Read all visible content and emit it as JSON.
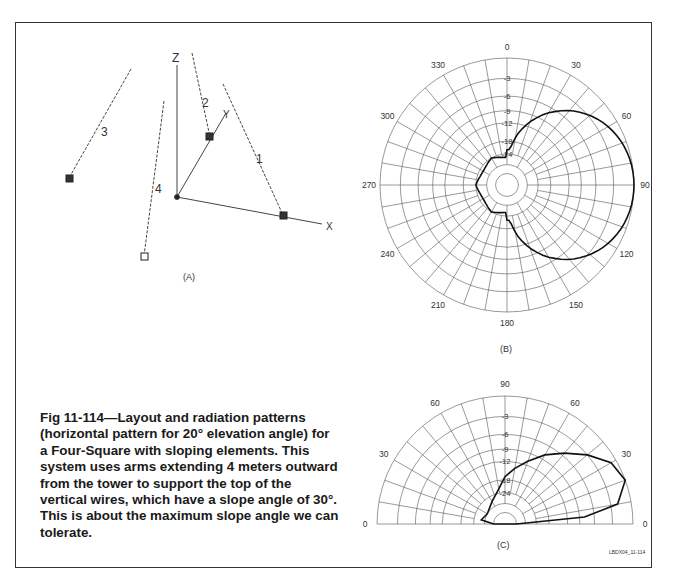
{
  "figure": {
    "caption": "Fig 11-114—Layout and radiation patterns (horizontal pattern for 20° elevation angle) for a Four-Square with sloping elements. This system uses arms extending 4 meters outward from the tower to support the top of the vertical wires, which have a slope angle of 30°. This is about the maximum slope angle we can tolerate.",
    "credit": "LBDX04_11-114"
  },
  "panel_a": {
    "label": "(A)",
    "axes": {
      "z": "Z",
      "y": "Y",
      "x": "X"
    },
    "elements": [
      "1",
      "2",
      "3",
      "4"
    ]
  },
  "panel_b": {
    "label": "(B)",
    "angle_labels": [
      "0",
      "30",
      "60",
      "90",
      "120",
      "150",
      "180",
      "210",
      "240",
      "270",
      "300",
      "330"
    ],
    "db_labels": [
      "-3",
      "-6",
      "-9",
      "-12",
      "-18",
      "-24"
    ]
  },
  "panel_c": {
    "label": "(C)",
    "angle_labels_left": [
      "0",
      "30",
      "60"
    ],
    "angle_label_top": "90",
    "angle_labels_right": [
      "60",
      "30",
      "0"
    ],
    "db_labels": [
      "-3",
      "-6",
      "-9",
      "-12",
      "-18",
      "-24"
    ]
  },
  "chart_data": [
    {
      "type": "polar",
      "title": "(B) Azimuth pattern at 20° elevation",
      "angle_unit": "degrees",
      "radial_unit": "dB",
      "radial_rings_db": [
        0,
        -3,
        -6,
        -9,
        -12,
        -18,
        -24
      ],
      "angular_ticks": [
        0,
        30,
        60,
        90,
        120,
        150,
        180,
        210,
        240,
        270,
        300,
        330
      ],
      "series": [
        {
          "name": "Four-Square sloping elements",
          "points": [
            {
              "az": 0,
              "db": -22
            },
            {
              "az": 20,
              "db": -10
            },
            {
              "az": 40,
              "db": -6
            },
            {
              "az": 60,
              "db": -2.5
            },
            {
              "az": 80,
              "db": -0.3
            },
            {
              "az": 90,
              "db": 0
            },
            {
              "az": 100,
              "db": -0.3
            },
            {
              "az": 120,
              "db": -2.5
            },
            {
              "az": 140,
              "db": -6
            },
            {
              "az": 160,
              "db": -10
            },
            {
              "az": 180,
              "db": -22
            },
            {
              "az": 210,
              "db": -25
            },
            {
              "az": 240,
              "db": -24
            },
            {
              "az": 260,
              "db": -26
            },
            {
              "az": 270,
              "db": -30
            },
            {
              "az": 280,
              "db": -26
            },
            {
              "az": 300,
              "db": -24
            },
            {
              "az": 330,
              "db": -25
            }
          ]
        }
      ]
    },
    {
      "type": "polar-half",
      "title": "(C) Elevation pattern",
      "angle_unit": "degrees",
      "radial_unit": "dB",
      "radial_rings_db": [
        0,
        -3,
        -6,
        -9,
        -12,
        -18,
        -24
      ],
      "angular_ticks": [
        0,
        30,
        60,
        90,
        60,
        30,
        0
      ],
      "series": [
        {
          "name": "Four-Square sloping elements",
          "points_forward": [
            {
              "el": 0,
              "db": -40
            },
            {
              "el": 5,
              "db": -8
            },
            {
              "el": 10,
              "db": -2
            },
            {
              "el": 20,
              "db": 0
            },
            {
              "el": 30,
              "db": -0.8
            },
            {
              "el": 40,
              "db": -3
            },
            {
              "el": 50,
              "db": -5.5
            },
            {
              "el": 60,
              "db": -8
            },
            {
              "el": 70,
              "db": -11
            },
            {
              "el": 80,
              "db": -14
            },
            {
              "el": 90,
              "db": -17
            }
          ],
          "points_back": [
            {
              "el": 80,
              "db": -22
            },
            {
              "el": 60,
              "db": -27
            },
            {
              "el": 30,
              "db": -30
            },
            {
              "el": 10,
              "db": -28
            },
            {
              "el": 0,
              "db": -40
            }
          ]
        }
      ]
    }
  ]
}
